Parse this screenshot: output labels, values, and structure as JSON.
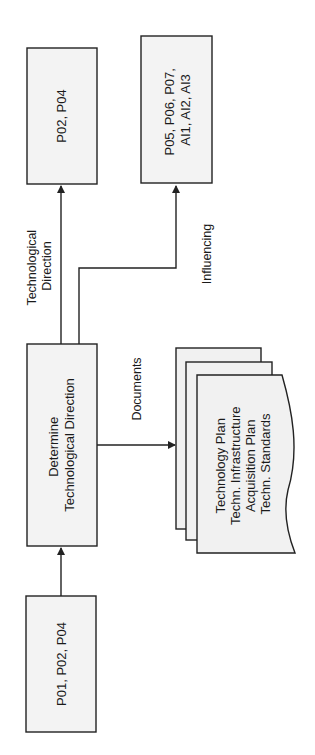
{
  "diagram": {
    "orientation": "rotated-90-ccw",
    "nodes": {
      "inputs": {
        "lines": [
          "P01, P02, P04"
        ]
      },
      "process": {
        "lines": [
          "Determine",
          "Technological Direction"
        ]
      },
      "output_direction": {
        "lines": [
          "P02, P04"
        ]
      },
      "output_influencing": {
        "lines": [
          "P05, P06, P07,",
          "AI1, AI2, AI3"
        ]
      },
      "documents": {
        "lines": [
          "Technology Plan",
          "Techn. Infrastructure",
          "Acquisition Plan",
          "Techn. Standards"
        ]
      }
    },
    "edges": {
      "direction_label": [
        "Technological",
        "Direction"
      ],
      "influencing_label": [
        "Influencing"
      ],
      "documents_label": [
        "Documents"
      ]
    }
  }
}
